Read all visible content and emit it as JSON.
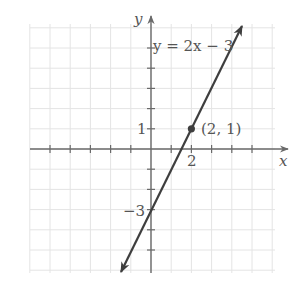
{
  "chart_data": {
    "type": "line",
    "title": "",
    "xlabel": "x",
    "ylabel": "y",
    "xlim": [
      -6,
      6
    ],
    "ylim": [
      -6,
      6
    ],
    "grid": true,
    "series": [
      {
        "name": "y = 2x − 3",
        "equation": "y = 2x − 3",
        "slope": 2,
        "intercept": -3,
        "x": [
          -1.5,
          0,
          2,
          4.5
        ],
        "y": [
          -6,
          -3,
          1,
          6
        ]
      }
    ],
    "points": [
      {
        "x": 2,
        "y": 1,
        "label": "(2, 1)"
      }
    ],
    "tick_labels": {
      "x": [
        {
          "value": 2,
          "label": "2"
        }
      ],
      "y": [
        {
          "value": 1,
          "label": "1"
        },
        {
          "value": -3,
          "label": "−3"
        }
      ]
    },
    "annotations": [
      {
        "text": "y = 2x − 3",
        "near": "upper line"
      },
      {
        "text": "(2, 1)",
        "near": "point"
      }
    ]
  },
  "labels": {
    "x_axis": "x",
    "y_axis": "y",
    "equation": "y = 2x − 3",
    "point": "(2, 1)",
    "x_tick_2": "2",
    "y_tick_1": "1",
    "y_tick_neg3": "−3"
  },
  "colors": {
    "axis": "#6a6a6a",
    "grid": "#e2e2e2",
    "line": "#3e3e3e",
    "text": "#555555"
  }
}
